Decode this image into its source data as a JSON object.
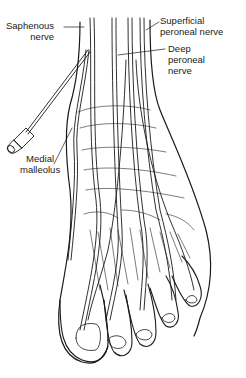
{
  "figure": {
    "labels": {
      "saphenous": {
        "line1": "Saphenous",
        "line2": "nerve"
      },
      "superficial_peroneal": {
        "line1": "Superficial",
        "line2": "peroneal nerve"
      },
      "deep_peroneal": {
        "line1": "Deep",
        "line2": "peroneal",
        "line3": "nerve"
      },
      "medial_malleolus": {
        "line1": "Medial",
        "line2": "malleolus"
      }
    },
    "colors": {
      "line": "#1a1a1a",
      "background": "#ffffff",
      "text": "#222222"
    }
  }
}
